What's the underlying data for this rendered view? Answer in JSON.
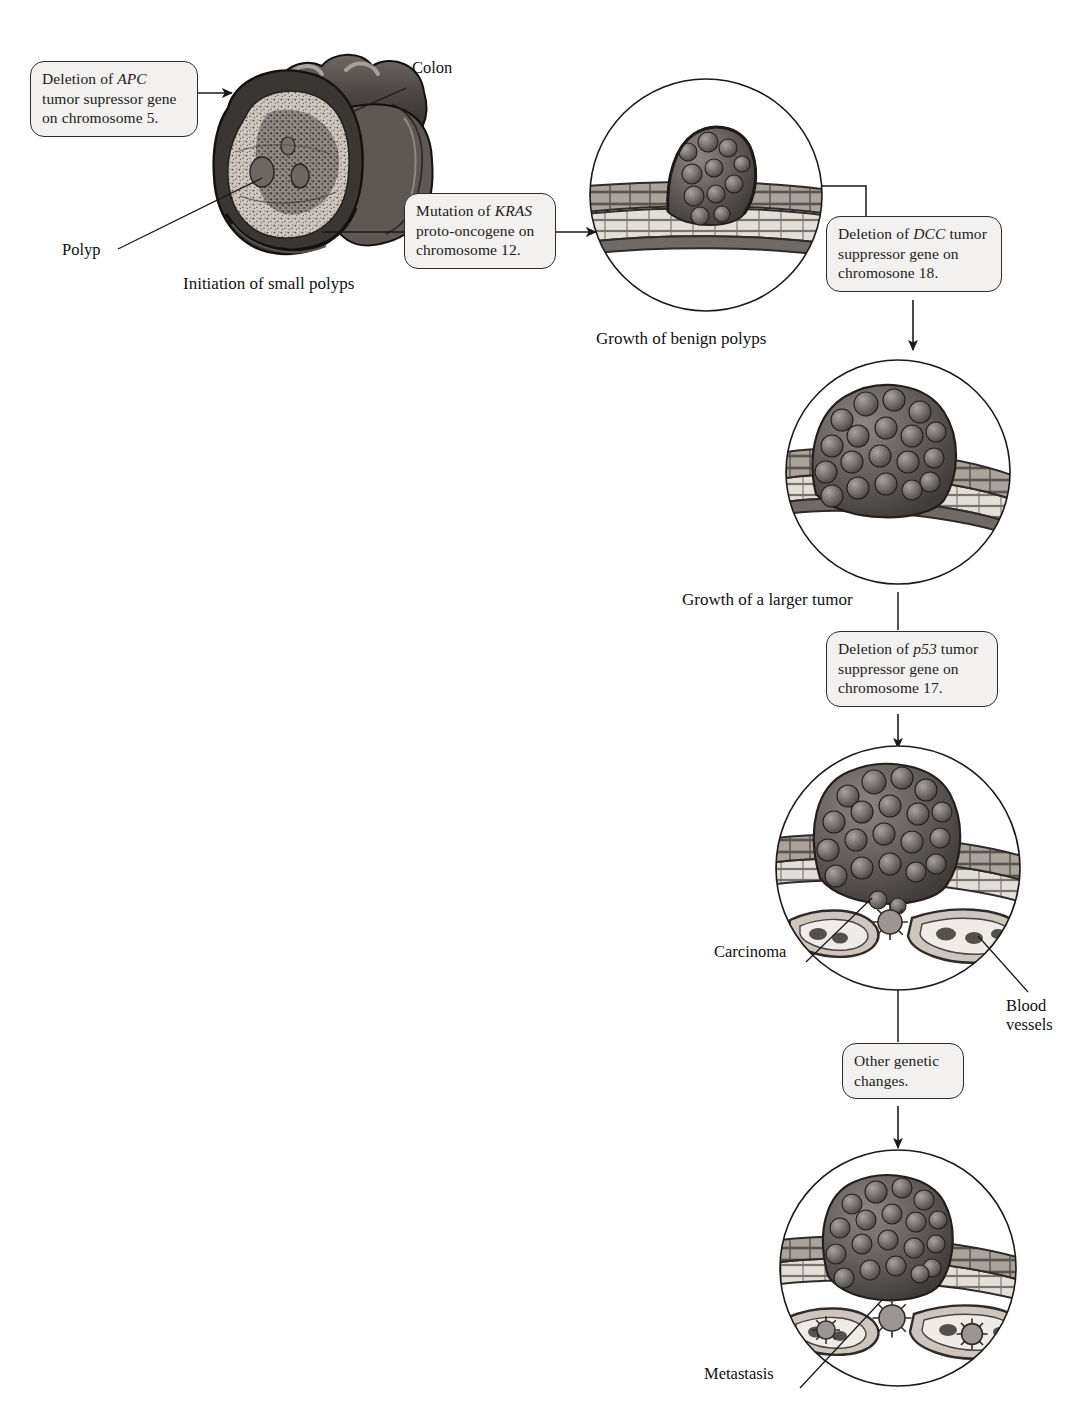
{
  "figure": {
    "type": "diagram"
  },
  "callouts": [
    {
      "id": "apc",
      "lines": [
        "Deletion of ",
        "APC",
        " tumor supressor gene on chromosome 5."
      ],
      "text_plain": "Deletion of APC tumor supressor gene on chromosome 5.",
      "gene": "APC",
      "before": "Deletion of ",
      "after": " tumor supressor gene on chromosome 5."
    },
    {
      "id": "kras",
      "text_plain": "Mutation of KRAS proto-oncogene on chromosome 12.",
      "gene": "KRAS",
      "before": "Mutation of ",
      "after": " proto-oncogene on chromosome 12."
    },
    {
      "id": "dcc",
      "text_plain": "Deletion of DCC tumor suppressor gene on chromosone 18.",
      "gene": "DCC",
      "before": "Deletion of ",
      "after": " tumor suppressor gene on chromosone 18."
    },
    {
      "id": "p53",
      "text_plain": "Deletion of p53 tumor suppressor gene on chromosome 17.",
      "gene": "p53",
      "before": "Deletion of ",
      "after": " tumor suppressor gene on chromosome 17."
    },
    {
      "id": "other",
      "text_plain": "Other genetic changes.",
      "gene": "",
      "before": "Other genetic changes.",
      "after": ""
    }
  ],
  "labels": {
    "colon": "Colon",
    "polyp": "Polyp",
    "blood_vessels_line1": "Blood",
    "blood_vessels_line2": "vessels",
    "carcinoma": "Carcinoma",
    "metastasis": "Metastasis"
  },
  "captions": {
    "stage1": "Initiation of small polyps",
    "stage2": "Growth of benign polyps",
    "stage3": "Growth of a larger tumor"
  },
  "colors": {
    "ink": "#1a1a1a",
    "callout_fill": "#f2f1ef",
    "callout_stroke": "#2b2b2b",
    "tissue_dark": "#3d3a38",
    "tissue_mid": "#8a8582",
    "tissue_light": "#cfcac4",
    "tumor_dark": "#4a4644",
    "tumor_mid": "#767170",
    "page": "#ffffff"
  }
}
